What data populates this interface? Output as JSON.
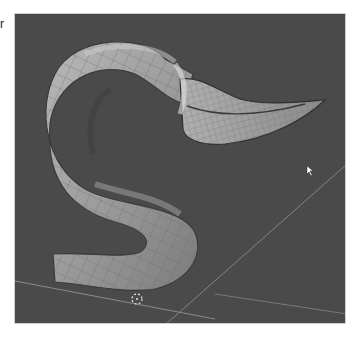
{
  "page": {
    "margin_text": "r"
  },
  "viewport": {
    "label": "3D viewport",
    "object": "S-shaped horn mesh",
    "background_color": "#4a4a4a",
    "mesh_color": "#a8a8a8",
    "grid_line_color": "#8a8a8a",
    "cursor_3d": "3d-cursor",
    "mouse_pointer": "arrow-pointer"
  }
}
